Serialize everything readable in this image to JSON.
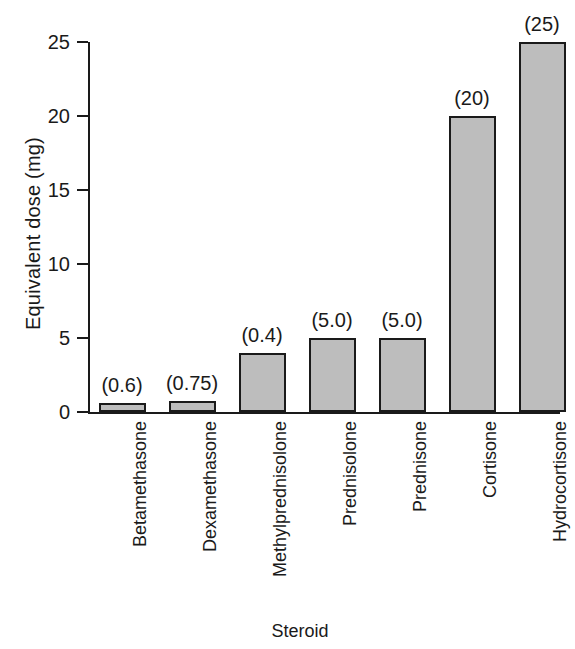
{
  "chart_data": {
    "type": "bar",
    "title": "",
    "xlabel": "Steroid",
    "ylabel": "Equivalent dose (mg)",
    "categories": [
      "Betamethasone",
      "Dexamethasone",
      "Methylprednisolone",
      "Prednisolone",
      "Prednisone",
      "Cortisone",
      "Hydrocortisone"
    ],
    "values": [
      0.6,
      0.75,
      4.0,
      5.0,
      5.0,
      20.0,
      25.0
    ],
    "point_labels": [
      "(0.6)",
      "(0.75)",
      "(0.4)",
      "(5.0)",
      "(5.0)",
      "(20)",
      "(25)"
    ],
    "ylim": [
      0,
      25
    ],
    "yticks": [
      0,
      5,
      10,
      15,
      20,
      25
    ],
    "ytick_labels": [
      "0",
      "5",
      "10",
      "15",
      "20",
      "25"
    ],
    "grid": false,
    "legend": false,
    "bar_fill_color": "#bdbdbd",
    "bar_edge_color": "#1a1a1a",
    "axis_color": "#1a1a1a",
    "background_color": "#ffffff"
  }
}
